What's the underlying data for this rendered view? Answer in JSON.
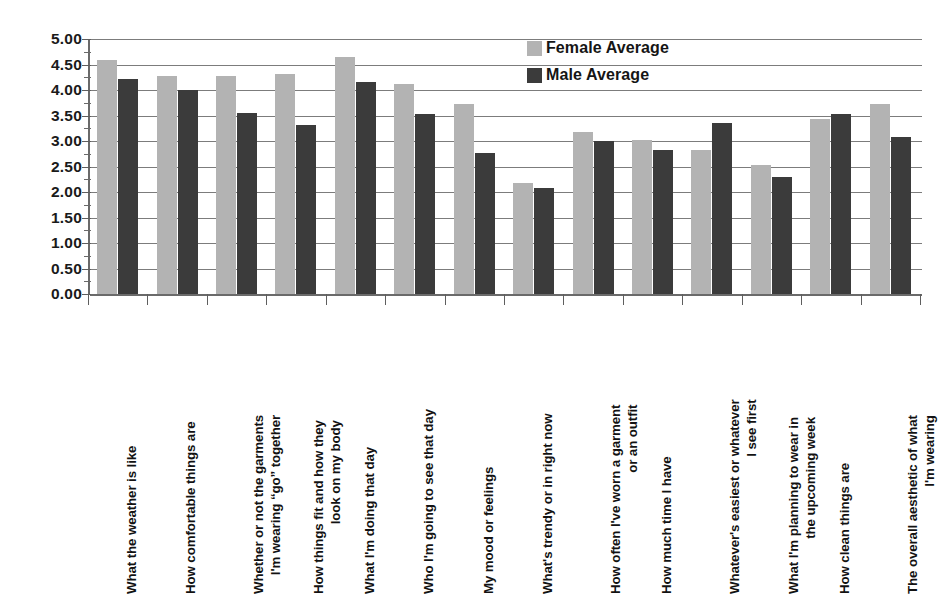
{
  "chart_data": {
    "type": "bar",
    "title": "",
    "xlabel": "",
    "ylabel": "",
    "ylim": [
      0,
      5
    ],
    "ytick_step": 0.5,
    "ytick_labels": [
      "0.00",
      "0.50",
      "1.00",
      "1.50",
      "2.00",
      "2.50",
      "3.00",
      "3.50",
      "4.00",
      "4.50",
      "5.00"
    ],
    "grid": true,
    "legend_position": "top-right",
    "orientation": "vertical",
    "categories": [
      "What the weather is like",
      "How comfortable things are",
      "Whether or not the garments I'm wearing “go” together",
      "How things fit and how they look on my body",
      "What I'm doing that day",
      "Who I'm going to see that day",
      "My mood or feelings",
      "What's trendy or in right now",
      "How often I've worn a garment or an outfit",
      "How much time I have",
      "Whatever's easiest or whatever I see first",
      "What I'm planning to wear in the upcoming week",
      "How clean things are",
      "The overall aesthetic of what I'm wearing"
    ],
    "category_lines": [
      [
        "What the weather is like"
      ],
      [
        "How comfortable things are"
      ],
      [
        "Whether or not the garments",
        "I'm wearing “go” together"
      ],
      [
        "How things fit and how they",
        "look on my body"
      ],
      [
        "What I'm doing that day"
      ],
      [
        "Who I'm going to see that day"
      ],
      [
        "My mood or feelings"
      ],
      [
        "What's trendy or in right now"
      ],
      [
        "How often I've worn a garment",
        "or an outfit"
      ],
      [
        "How much time I have"
      ],
      [
        "Whatever's easiest or whatever",
        "I see first"
      ],
      [
        "What I'm planning to wear in",
        "the upcoming week"
      ],
      [
        "How clean things are"
      ],
      [
        "The overall aesthetic of what",
        "I'm wearing"
      ]
    ],
    "series": [
      {
        "name": "Female Average",
        "color": "#b3b3b3",
        "values": [
          4.58,
          4.28,
          4.28,
          4.32,
          4.65,
          4.12,
          3.73,
          2.18,
          3.18,
          3.02,
          2.82,
          2.53,
          3.43,
          3.73
        ]
      },
      {
        "name": "Male Average",
        "color": "#3b3b3b",
        "values": [
          4.21,
          4.01,
          3.55,
          3.31,
          4.15,
          3.52,
          2.76,
          2.08,
          3.0,
          2.83,
          3.35,
          2.3,
          3.53,
          3.07
        ]
      }
    ]
  },
  "legend": {
    "items": [
      {
        "label": "Female Average",
        "swatch": "female"
      },
      {
        "label": "Male Average",
        "swatch": "male"
      }
    ]
  }
}
